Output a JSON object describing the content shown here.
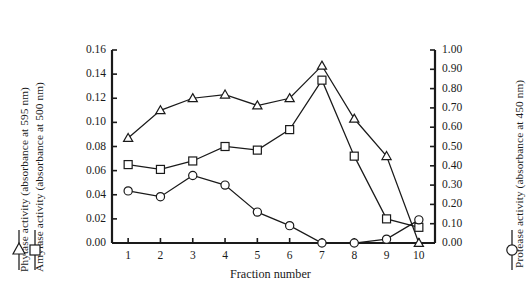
{
  "chart_data": {
    "type": "line",
    "title": "",
    "xlabel": "Fraction number",
    "x": [
      1,
      2,
      3,
      4,
      5,
      6,
      7,
      8,
      9,
      10
    ],
    "categories": [
      "1",
      "2",
      "3",
      "4",
      "5",
      "6",
      "7",
      "8",
      "9",
      "10"
    ],
    "xlim": [
      0.5,
      10.5
    ],
    "grid": false,
    "legend_position": "axis-labels",
    "axes": {
      "left": {
        "label": "Phytase activity (absorbance at 595 nm)\nAmylase activity (absorbance at 500 nm)",
        "label_line1": "Phytase activity (absorbance at 595 nm)",
        "label_line2": "Amylase activity (absorbance at 500 nm)",
        "ylim": [
          0.0,
          0.16
        ],
        "tick_step": 0.02,
        "ticks": [
          "0.00",
          "0.02",
          "0.04",
          "0.06",
          "0.08",
          "0.10",
          "0.12",
          "0.14",
          "0.16"
        ]
      },
      "right": {
        "label": "Protease activity (absorbance at 450 nm)",
        "ylim": [
          0.0,
          1.0
        ],
        "tick_step": 0.1,
        "ticks": [
          "0.00",
          "0.10",
          "0.20",
          "0.30",
          "0.40",
          "0.50",
          "0.60",
          "0.70",
          "0.80",
          "0.90",
          "1.00"
        ]
      }
    },
    "series": [
      {
        "name": "Phytase activity (absorbance at 595 nm)",
        "marker": "triangle",
        "axis": "left",
        "color": "#1a1a1a",
        "values": [
          0.087,
          0.11,
          0.12,
          0.123,
          0.114,
          0.12,
          0.147,
          0.103,
          0.072,
          0.0
        ]
      },
      {
        "name": "Amylase activity (absorbance at 500 nm)",
        "marker": "square",
        "axis": "left",
        "color": "#1a1a1a",
        "values": [
          0.065,
          0.061,
          0.068,
          0.08,
          0.077,
          0.094,
          0.135,
          0.072,
          0.02,
          0.013
        ]
      },
      {
        "name": "Protease activity (absorbance at 450 nm)",
        "marker": "circle",
        "axis": "right",
        "color": "#1a1a1a",
        "values": [
          0.27,
          0.24,
          0.35,
          0.3,
          0.16,
          0.09,
          0.0,
          0.0,
          0.02,
          0.12
        ]
      }
    ]
  },
  "legend": {
    "left_markers": [
      "triangle",
      "square"
    ],
    "right_marker": "circle"
  }
}
